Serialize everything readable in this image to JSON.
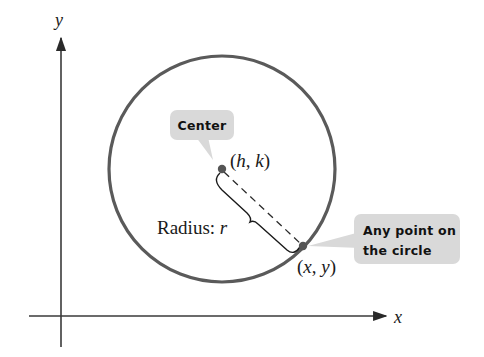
{
  "diagram": {
    "type": "circle-standard-form",
    "axes": {
      "x_label": "x",
      "y_label": "y"
    },
    "circle": {
      "center_label": "(h, k)",
      "center_label_parts": {
        "open": "(",
        "h": "h",
        "comma": ", ",
        "k": "k",
        "close": ")"
      },
      "point_label_parts": {
        "open": "(",
        "x": "x",
        "comma": ", ",
        "y": "y",
        "close": ")"
      },
      "point_label": "(x, y)",
      "radius_label_prefix": "Radius: ",
      "radius_symbol": "r"
    },
    "callouts": {
      "center": "Center",
      "point_line1": "Any point on",
      "point_line2": "the circle"
    },
    "colors": {
      "circle_stroke": "#5a5a5a",
      "axis_stroke": "#3a3a3a",
      "callout_fill": "#d9d9d9",
      "point_fill": "#555555"
    }
  }
}
